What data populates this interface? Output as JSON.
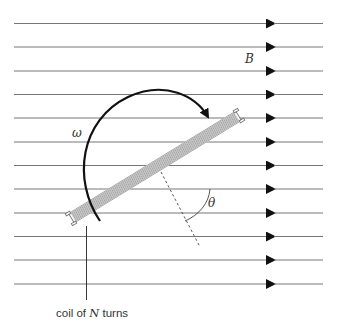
{
  "diagram": {
    "labels": {
      "field": "B",
      "angular_velocity": "ω",
      "angle": "θ",
      "coil_prefix": "coil of ",
      "coil_var": "N",
      "coil_suffix": " turns"
    },
    "field_lines": {
      "count": 12,
      "y_positions": [
        23.5,
        47,
        71,
        94.5,
        118,
        142,
        165.5,
        189,
        213,
        236.5,
        260,
        284
      ],
      "x_start": 14,
      "x_end": 323,
      "arrow_x": 266,
      "direction": "right"
    },
    "coil": {
      "center": [
        155,
        167
      ],
      "angle_deg": -31.5,
      "length": 196,
      "turns_drawn": 11
    },
    "colors": {
      "field_line": "#777777",
      "arrow": "#111111",
      "coil": "#888888",
      "rotation_arc": "#111111",
      "text": "#333333"
    }
  }
}
